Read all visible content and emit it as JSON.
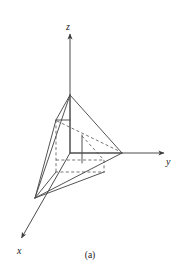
{
  "figure": {
    "caption": "(a)",
    "type": "3d-coordinate-diagram",
    "background_color": "#ffffff",
    "line_color": "#4d4d4d",
    "dashed_color": "#595959",
    "label_color": "#1a1a1a",
    "axes": [
      {
        "id": "z",
        "label": "z",
        "label_x": 66,
        "label_y": 22,
        "from": [
          70,
          153
        ],
        "to": [
          70,
          34
        ],
        "arrow": true,
        "style": "solid"
      },
      {
        "id": "y",
        "label": "y",
        "label_x": 166,
        "label_y": 157,
        "from": [
          70,
          153
        ],
        "to": [
          166,
          153
        ],
        "arrow": true,
        "style": "solid"
      },
      {
        "id": "x",
        "label": "x",
        "label_x": 17,
        "label_y": 246,
        "from": [
          70,
          153
        ],
        "to": [
          20,
          241
        ],
        "arrow": true,
        "style": "solid"
      }
    ],
    "vertices": {
      "origin": [
        70,
        153
      ],
      "apex": [
        70,
        95
      ],
      "y_vertex": [
        122,
        153
      ],
      "x_vertex": [
        35,
        198
      ],
      "back_top": [
        56,
        120
      ],
      "back_left": [
        56,
        160
      ],
      "base_front_left": [
        56,
        172
      ],
      "base_front_right": [
        104,
        172
      ],
      "base_back_right": [
        104,
        160
      ],
      "mid_solid_top": [
        82,
        135
      ],
      "mid_solid_bottom": [
        82,
        163
      ]
    },
    "edges_solid": [
      {
        "name": "apex-to-y-vertex",
        "from": [
          70,
          95
        ],
        "to": [
          122,
          153
        ]
      },
      {
        "name": "apex-to-x-vertex",
        "from": [
          70,
          95
        ],
        "to": [
          35,
          198
        ]
      },
      {
        "name": "apex-to-back-top",
        "from": [
          70,
          95
        ],
        "to": [
          56,
          120
        ]
      },
      {
        "name": "back-top-to-x-vertex",
        "from": [
          56,
          120
        ],
        "to": [
          35,
          198
        ]
      },
      {
        "name": "y-vertex-to-x-vertex",
        "from": [
          122,
          153
        ],
        "to": [
          35,
          198
        ]
      },
      {
        "name": "base-front-right-to-x-vertex",
        "from": [
          104,
          172
        ],
        "to": [
          35,
          198
        ]
      },
      {
        "name": "base-front-left-to-x-vertex",
        "from": [
          56,
          172
        ],
        "to": [
          35,
          198
        ]
      },
      {
        "name": "apex-vertical-to-origin",
        "from": [
          70,
          95
        ],
        "to": [
          70,
          153
        ]
      },
      {
        "name": "origin-to-y-vertex",
        "from": [
          70,
          153
        ],
        "to": [
          122,
          153
        ]
      },
      {
        "name": "interior-vertical",
        "from": [
          82,
          135
        ],
        "to": [
          82,
          163
        ]
      },
      {
        "name": "back-top-to-apex-hatch",
        "from": [
          56,
          120
        ],
        "to": [
          70,
          120
        ]
      }
    ],
    "edges_dashed": [
      {
        "name": "back-vertical",
        "from": [
          56,
          120
        ],
        "to": [
          56,
          172
        ]
      },
      {
        "name": "base-back-edge",
        "from": [
          56,
          160
        ],
        "to": [
          104,
          160
        ]
      },
      {
        "name": "base-front-edge",
        "from": [
          56,
          172
        ],
        "to": [
          104,
          172
        ]
      },
      {
        "name": "base-right-edge",
        "from": [
          104,
          160
        ],
        "to": [
          104,
          172
        ]
      },
      {
        "name": "base-left-edge",
        "from": [
          56,
          160
        ],
        "to": [
          56,
          172
        ]
      },
      {
        "name": "inner-diagonal",
        "from": [
          56,
          120
        ],
        "to": [
          122,
          153
        ]
      },
      {
        "name": "inner-diagonal-lower",
        "from": [
          82,
          135
        ],
        "to": [
          104,
          160
        ]
      }
    ]
  }
}
